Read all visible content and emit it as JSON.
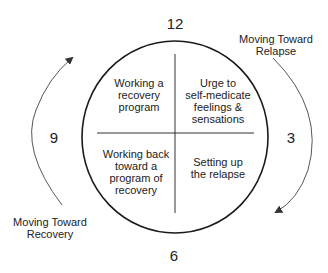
{
  "diagram": {
    "clock_positions": {
      "twelve": "12",
      "three": "3",
      "six": "6",
      "nine": "9"
    },
    "quadrants": {
      "top_left": [
        "Working a",
        "recovery",
        "program"
      ],
      "top_right": [
        "Urge to",
        "self-medicate",
        "feelings &",
        "sensations"
      ],
      "bottom_left": [
        "Working back",
        "toward a",
        "program of",
        "recovery"
      ],
      "bottom_right": [
        "Setting up",
        "the relapse"
      ]
    },
    "arrows": {
      "right": {
        "label": [
          "Moving Toward",
          "Relapse"
        ],
        "direction": "clockwise-down"
      },
      "left": {
        "label": [
          "Moving Toward",
          "Recovery"
        ],
        "direction": "clockwise-up"
      }
    },
    "colors": {
      "stroke": "#1a1a1a",
      "arrow": "#444444",
      "background": "#ffffff"
    }
  }
}
